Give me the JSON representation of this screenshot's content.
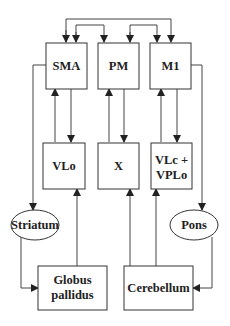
{
  "diagram": {
    "type": "block-diagram",
    "colors": {
      "stroke": "#333333",
      "text": "#222222",
      "background": "#ffffff"
    },
    "nodes": {
      "sma": {
        "id": "sma",
        "shape": "rect",
        "lines": [
          "SMA"
        ]
      },
      "pm": {
        "id": "pm",
        "shape": "rect",
        "lines": [
          "PM"
        ]
      },
      "m1": {
        "id": "m1",
        "shape": "rect",
        "lines": [
          "M1"
        ]
      },
      "vlo": {
        "id": "vlo",
        "shape": "rect",
        "lines": [
          "VLo"
        ]
      },
      "x": {
        "id": "x",
        "shape": "rect",
        "lines": [
          "X"
        ]
      },
      "vlc": {
        "id": "vlc",
        "shape": "rect",
        "lines": [
          "VLc +",
          "VPLo"
        ]
      },
      "striatum": {
        "id": "striatum",
        "shape": "ellipse",
        "lines": [
          "Striatum"
        ]
      },
      "pons": {
        "id": "pons",
        "shape": "ellipse",
        "lines": [
          "Pons"
        ]
      },
      "gp": {
        "id": "gp",
        "shape": "rect",
        "lines": [
          "Globus",
          "pallidus"
        ]
      },
      "cerebellum": {
        "id": "cerebellum",
        "shape": "rect",
        "lines": [
          "Cerebellum"
        ]
      }
    },
    "edges": [
      {
        "from": "sma",
        "to": "m1",
        "bidirectional": true
      },
      {
        "from": "sma",
        "to": "pm",
        "bidirectional": true
      },
      {
        "from": "pm",
        "to": "m1",
        "bidirectional": true
      },
      {
        "from": "sma",
        "to": "vlo"
      },
      {
        "from": "vlo",
        "to": "sma"
      },
      {
        "from": "pm",
        "to": "x"
      },
      {
        "from": "x",
        "to": "pm"
      },
      {
        "from": "m1",
        "to": "vlc"
      },
      {
        "from": "vlc",
        "to": "m1"
      },
      {
        "from": "sma",
        "to": "striatum"
      },
      {
        "from": "striatum",
        "to": "gp"
      },
      {
        "from": "gp",
        "to": "vlo"
      },
      {
        "from": "m1",
        "to": "pons"
      },
      {
        "from": "pons",
        "to": "cerebellum"
      },
      {
        "from": "cerebellum",
        "to": "x"
      },
      {
        "from": "cerebellum",
        "to": "vlc"
      }
    ]
  }
}
